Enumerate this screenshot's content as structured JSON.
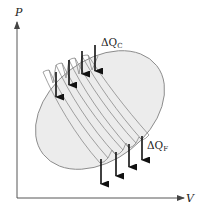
{
  "diagram": {
    "type": "pv-diagram",
    "axes": {
      "y_label": "P",
      "x_label": "V"
    },
    "annotations": {
      "heat_in": {
        "delta": "ΔQ",
        "subscript": "C"
      },
      "heat_out": {
        "delta": "ΔQ",
        "subscript": "F"
      }
    },
    "colors": {
      "cycle_fill": "#ececec",
      "cycle_stroke": "#8a8a8a",
      "arrow": "#111111",
      "axis": "#444444"
    },
    "carnot_cycles_count": 4,
    "heat_in_arrows_count": 4,
    "heat_out_arrows_count": 4
  }
}
